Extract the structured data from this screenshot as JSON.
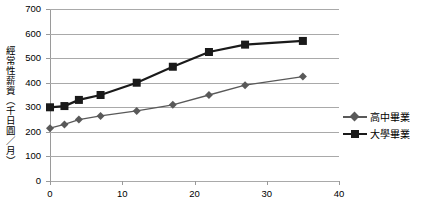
{
  "chart_data": {
    "type": "line",
    "title": "",
    "subtitle": "",
    "xlabel": "",
    "ylabel": "經常性薪資（千日圓／月）",
    "xlim": [
      0,
      40
    ],
    "ylim": [
      0,
      700
    ],
    "grid": true,
    "legend_position": "right",
    "x_ticks": [
      "0",
      "10",
      "20",
      "30",
      "40"
    ],
    "x_tick_values": [
      0,
      10,
      20,
      30,
      40
    ],
    "y_ticks": [
      "0",
      "100",
      "200",
      "300",
      "400",
      "500",
      "600",
      "700"
    ],
    "y_tick_values": [
      0,
      100,
      200,
      300,
      400,
      500,
      600,
      700
    ],
    "series": [
      {
        "name": "高中畢業",
        "marker": "diamond",
        "color": "#595959",
        "x": [
          0,
          2,
          4,
          7,
          12,
          17,
          22,
          27,
          35
        ],
        "values": [
          215,
          230,
          250,
          265,
          285,
          310,
          350,
          390,
          425
        ]
      },
      {
        "name": "大學畢業",
        "marker": "square",
        "color": "#1a1a1a",
        "x": [
          0,
          2,
          4,
          7,
          12,
          17,
          22,
          27,
          35
        ],
        "values": [
          300,
          305,
          330,
          350,
          400,
          465,
          525,
          555,
          570
        ]
      }
    ]
  },
  "axes": {
    "y_title": "經常性薪資（千日圓／月）"
  },
  "legend": {
    "items": [
      {
        "label": "高中畢業",
        "marker": "diamond",
        "color": "#595959"
      },
      {
        "label": "大學畢業",
        "marker": "square",
        "color": "#1a1a1a"
      }
    ]
  },
  "colors": {
    "gridline": "#a9a9a9",
    "axis": "#9a9a9a",
    "series_highschool": "#595959",
    "series_university": "#1a1a1a",
    "background": "#ffffff"
  }
}
